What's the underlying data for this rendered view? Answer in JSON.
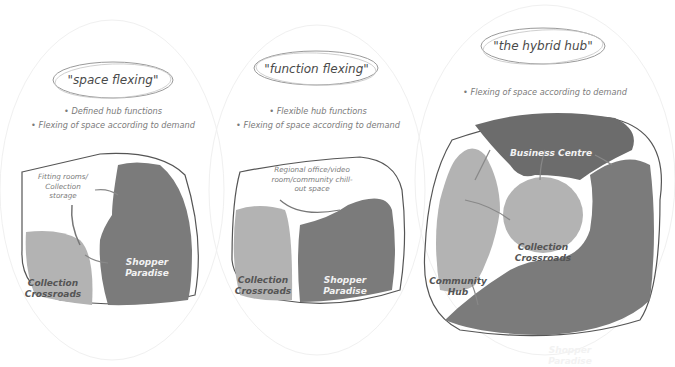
{
  "colors": {
    "dark_zone": "#7b7b7b",
    "light_zone": "#b3b3b3",
    "darkest_zone": "#6c6c6c",
    "outline": "#555555",
    "background": "#ffffff"
  },
  "panels": [
    {
      "title": "\"space flexing\"",
      "bullets": [
        "Defined hub functions",
        "Flexing of space according to demand"
      ],
      "zones": [
        {
          "label": "Collection\nCrossroads",
          "line1": "Collection",
          "line2": "Crossroads",
          "shade": "light"
        },
        {
          "label": "Shopper\nParadise",
          "line1": "Shopper",
          "line2": "Paradise",
          "shade": "dark"
        }
      ],
      "annotation": {
        "line1": "Fitting rooms/",
        "line2": "Collection",
        "line3": "storage"
      }
    },
    {
      "title": "\"function flexing\"",
      "bullets": [
        "Flexible hub functions",
        "Flexing of space according to demand"
      ],
      "zones": [
        {
          "line1": "Collection",
          "line2": "Crossroads",
          "shade": "light"
        },
        {
          "line1": "Shopper",
          "line2": "Paradise",
          "shade": "dark"
        }
      ],
      "annotation": {
        "line1": "Regional office/video",
        "line2": "room/community chill-",
        "line3": "out space"
      }
    },
    {
      "title": "\"the hybrid hub\"",
      "bullets": [
        "Flexing of space according to demand"
      ],
      "zones": [
        {
          "line1": "Business Centre",
          "shade": "darkest"
        },
        {
          "line1": "Collection",
          "line2": "Crossroads",
          "shade": "light"
        },
        {
          "line1": "Community",
          "line2": "Hub",
          "shade": "light"
        },
        {
          "line1": "Shopper",
          "line2": "Paradise",
          "shade": "dark"
        }
      ]
    }
  ]
}
